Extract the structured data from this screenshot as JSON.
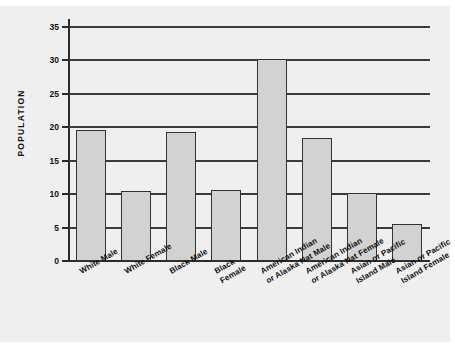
{
  "chart_data": {
    "type": "bar",
    "title": "",
    "xlabel": "",
    "ylabel": "POPULATION",
    "ylim": [
      0,
      35
    ],
    "yticks": [
      0,
      5,
      10,
      15,
      20,
      25,
      30,
      35
    ],
    "grid": true,
    "legend": false,
    "categories": [
      "White Male",
      "White Female",
      "Black Male",
      "Black\nFemale",
      "American Indian\nor Alaska Nat Male",
      "American Indian\nor Alaska Nat Female",
      "Asian or Pacific\nIsland Male",
      "Asian or Pacific\nIsland Female"
    ],
    "values": [
      19.6,
      10.5,
      19.3,
      10.6,
      30.2,
      18.4,
      10.2,
      5.6
    ],
    "colors": {
      "bar_fill": "#d2d2d2",
      "bar_edge": "#333333",
      "grid": "#3a3a3a",
      "axis": "#2b2b2b",
      "background": "#efefef",
      "text": "#111111"
    }
  },
  "axis": {
    "y_title": "POPULATION",
    "tick_labels": [
      "35",
      "30",
      "25",
      "20",
      "15",
      "10",
      "5",
      "0"
    ]
  }
}
